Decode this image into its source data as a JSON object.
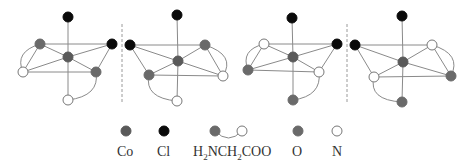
{
  "figure": {
    "colors": {
      "co": "#5a5a5a",
      "cl": "#0a0a0a",
      "o": "#6a6a6a",
      "n_fill": "#ffffff",
      "n_stroke": "#777777",
      "bond": "#8a8a8a"
    },
    "mirror_planes": [
      {
        "x": 122,
        "y1": 24,
        "y2": 104
      },
      {
        "x": 347,
        "y1": 24,
        "y2": 104
      }
    ],
    "structures": [
      {
        "id": "isomer-1",
        "atoms": [
          {
            "el": "Cl",
            "x": 68,
            "y": 17
          },
          {
            "el": "O",
            "x": 40,
            "y": 44
          },
          {
            "el": "Cl",
            "x": 112,
            "y": 44
          },
          {
            "el": "Co",
            "x": 68,
            "y": 57
          },
          {
            "el": "N",
            "x": 23,
            "y": 72
          },
          {
            "el": "O",
            "x": 96,
            "y": 72
          },
          {
            "el": "N",
            "x": 68,
            "y": 100
          }
        ],
        "bonds": [
          [
            0,
            3
          ],
          [
            3,
            6
          ],
          [
            1,
            3
          ],
          [
            3,
            2
          ],
          [
            3,
            4
          ],
          [
            3,
            5
          ],
          [
            1,
            2
          ],
          [
            4,
            5
          ],
          [
            1,
            4
          ],
          [
            2,
            5
          ]
        ],
        "chelates": [
          [
            1,
            4,
            "M 40 44 Q 14 52 23 72"
          ],
          [
            5,
            6,
            "M 96 72 Q 100 96 68 100"
          ]
        ]
      },
      {
        "id": "isomer-2",
        "atoms": [
          {
            "el": "Cl",
            "x": 177,
            "y": 15
          },
          {
            "el": "Cl",
            "x": 130,
            "y": 45
          },
          {
            "el": "O",
            "x": 205,
            "y": 45
          },
          {
            "el": "Co",
            "x": 178,
            "y": 61
          },
          {
            "el": "O",
            "x": 149,
            "y": 75
          },
          {
            "el": "N",
            "x": 223,
            "y": 76
          },
          {
            "el": "N",
            "x": 177,
            "y": 101
          }
        ],
        "bonds": [
          [
            0,
            3
          ],
          [
            3,
            6
          ],
          [
            1,
            3
          ],
          [
            3,
            2
          ],
          [
            3,
            4
          ],
          [
            3,
            5
          ],
          [
            1,
            2
          ],
          [
            4,
            5
          ],
          [
            1,
            4
          ],
          [
            2,
            5
          ]
        ],
        "chelates": [
          [
            2,
            5,
            "M 205 45 Q 236 55 223 76"
          ],
          [
            4,
            6,
            "M 149 75 Q 144 98 177 101"
          ]
        ]
      },
      {
        "id": "isomer-3",
        "atoms": [
          {
            "el": "Cl",
            "x": 292,
            "y": 18
          },
          {
            "el": "N",
            "x": 264,
            "y": 44
          },
          {
            "el": "Cl",
            "x": 337,
            "y": 44
          },
          {
            "el": "Co",
            "x": 293,
            "y": 57
          },
          {
            "el": "O",
            "x": 248,
            "y": 70
          },
          {
            "el": "N",
            "x": 319,
            "y": 72
          },
          {
            "el": "O",
            "x": 293,
            "y": 100
          }
        ],
        "bonds": [
          [
            0,
            3
          ],
          [
            3,
            6
          ],
          [
            1,
            3
          ],
          [
            3,
            2
          ],
          [
            3,
            4
          ],
          [
            3,
            5
          ],
          [
            1,
            2
          ],
          [
            4,
            5
          ],
          [
            1,
            4
          ],
          [
            2,
            5
          ]
        ],
        "chelates": [
          [
            1,
            4,
            "M 264 44 Q 240 50 248 70"
          ],
          [
            5,
            6,
            "M 319 72 Q 322 96 293 100"
          ]
        ]
      },
      {
        "id": "isomer-4",
        "atoms": [
          {
            "el": "Cl",
            "x": 402,
            "y": 16
          },
          {
            "el": "Cl",
            "x": 355,
            "y": 45
          },
          {
            "el": "N",
            "x": 432,
            "y": 45
          },
          {
            "el": "Co",
            "x": 403,
            "y": 62
          },
          {
            "el": "N",
            "x": 374,
            "y": 77
          },
          {
            "el": "O",
            "x": 451,
            "y": 76
          },
          {
            "el": "O",
            "x": 402,
            "y": 102
          }
        ],
        "bonds": [
          [
            0,
            3
          ],
          [
            3,
            6
          ],
          [
            1,
            3
          ],
          [
            3,
            2
          ],
          [
            3,
            4
          ],
          [
            3,
            5
          ],
          [
            1,
            2
          ],
          [
            4,
            5
          ],
          [
            1,
            4
          ],
          [
            2,
            5
          ]
        ],
        "chelates": [
          [
            2,
            5,
            "M 432 45 Q 462 54 451 76"
          ],
          [
            4,
            6,
            "M 374 77 Q 368 100 402 102"
          ]
        ]
      }
    ]
  },
  "legend": {
    "items": [
      {
        "key": "Co",
        "symbol": "co",
        "label": "Co",
        "dot_x": 126,
        "label_x": 117
      },
      {
        "key": "Cl",
        "symbol": "cl",
        "label": "Cl",
        "dot_x": 164,
        "label_x": 157
      },
      {
        "key": "glycinate",
        "symbol": "chelate",
        "label_prefix": "H",
        "label_sub1": "2",
        "label_mid": "NCH",
        "label_sub2": "2",
        "label_suffix": "COO",
        "dot_x": 215,
        "dot_x2": 242,
        "label_x": 193
      },
      {
        "key": "O",
        "symbol": "o",
        "label": "O",
        "dot_x": 298,
        "label_x": 292
      },
      {
        "key": "N",
        "symbol": "n",
        "label": "N",
        "dot_x": 337,
        "label_x": 332
      }
    ],
    "dot_y": 131
  }
}
